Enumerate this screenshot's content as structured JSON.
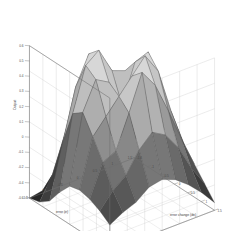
{
  "figure": {
    "kind": "matlab-3d-surface-plot",
    "background_color": "#ffffff",
    "grid_color": "#c9c9c9",
    "axis_line_color": "#6e6e6e",
    "edge_color": "#4d4d4d",
    "colormap": "gray"
  },
  "axes": {
    "x": {
      "label": "error (e)",
      "ticks": [
        "-1.5",
        "-1",
        "-0.5",
        "0",
        "0.5",
        "1",
        "1.5"
      ],
      "min": -1.5,
      "max": 1.5
    },
    "y": {
      "label": "error change (de)",
      "ticks": [
        "-1.5",
        "-1",
        "-0.5",
        "0",
        "0.5",
        "1",
        "1.5"
      ],
      "min": -1.5,
      "max": 1.5
    },
    "z": {
      "label": "Output",
      "ticks": [
        "0.6",
        "0.4",
        "0.2",
        "0",
        "-0.2",
        "-0.4",
        "-0.6"
      ],
      "tick_labels_all": [
        "0.6",
        "0.5",
        "0.4",
        "0.3",
        "0.2",
        "0.1",
        "0",
        "-0.1",
        "-0.2",
        "-0.4",
        "-0.6"
      ],
      "min": -0.6,
      "max": 0.6
    }
  },
  "chart_data": {
    "type": "surface",
    "title": "",
    "xlabel": "error (e)",
    "ylabel": "error change (de)",
    "zlabel": "Output",
    "xlim": [
      -1.5,
      1.5
    ],
    "ylim": [
      -1.5,
      1.5
    ],
    "zlim": [
      -0.6,
      0.6
    ],
    "grid": true,
    "legend": "none",
    "colormap": "gray",
    "shading": "faceted",
    "peak_count": 3,
    "x": [
      -1.5,
      -1.125,
      -0.75,
      -0.375,
      0,
      0.375,
      0.75,
      1.125,
      1.5
    ],
    "y": [
      -1.5,
      -1.125,
      -0.75,
      -0.375,
      0,
      0.375,
      0.75,
      1.125,
      1.5
    ],
    "z": [
      [
        -0.6,
        -0.58,
        -0.52,
        -0.4,
        -0.3,
        -0.28,
        -0.3,
        -0.34,
        -0.4
      ],
      [
        -0.58,
        -0.4,
        -0.1,
        0.18,
        0.24,
        0.1,
        -0.05,
        -0.22,
        -0.34
      ],
      [
        -0.52,
        -0.1,
        0.3,
        0.52,
        0.46,
        0.22,
        0.0,
        -0.14,
        -0.3
      ],
      [
        -0.4,
        0.18,
        0.52,
        0.6,
        0.4,
        0.34,
        0.26,
        0.02,
        -0.22
      ],
      [
        -0.3,
        0.24,
        0.46,
        0.4,
        0.18,
        0.46,
        0.54,
        0.12,
        -0.2
      ],
      [
        -0.3,
        0.1,
        0.22,
        0.36,
        0.48,
        0.58,
        0.4,
        0.06,
        -0.24
      ],
      [
        -0.34,
        -0.05,
        0.0,
        0.26,
        0.52,
        0.42,
        0.16,
        -0.08,
        -0.32
      ],
      [
        -0.4,
        -0.22,
        -0.14,
        0.02,
        0.14,
        0.06,
        -0.1,
        -0.28,
        -0.42
      ],
      [
        -0.46,
        -0.36,
        -0.3,
        -0.22,
        -0.18,
        -0.24,
        -0.34,
        -0.44,
        -0.54
      ]
    ]
  }
}
